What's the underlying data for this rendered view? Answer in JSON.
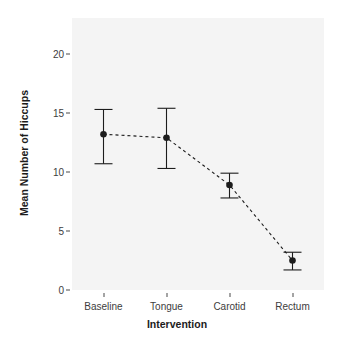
{
  "chart_data": {
    "type": "line",
    "title": "",
    "subtitle": "",
    "xlabel": "Intervention",
    "ylabel": "Mean Number of Hiccups",
    "categories": [
      "Baseline",
      "Tongue",
      "Carotid",
      "Rectum"
    ],
    "values": [
      13.2,
      12.9,
      8.9,
      2.5
    ],
    "error_low": [
      10.7,
      10.3,
      7.8,
      1.7
    ],
    "error_high": [
      15.3,
      15.4,
      9.9,
      3.2
    ],
    "series": [
      {
        "name": "Mean Number of Hiccups",
        "values": [
          13.2,
          12.9,
          8.9,
          2.5
        ]
      }
    ],
    "ylim": [
      0,
      22.5
    ],
    "yticks": [
      0,
      5,
      10,
      15,
      20
    ],
    "ytick_labels": [
      "0",
      "5",
      "10",
      "15",
      "20"
    ],
    "xtick_labels": [
      "Baseline",
      "Tongue",
      "Carotid",
      "Rectum"
    ],
    "grid": false,
    "legend": "none",
    "line_style": "dashed",
    "marker": "filled-circle",
    "errorbar_style": "capped",
    "panel_background": "#f4f4f4",
    "plot_foreground": "#1c1c1c",
    "tick_label_color": "#3d3d3d",
    "figure_background": "#ffffff"
  },
  "axes": {
    "y_title": "Mean Number of Hiccups",
    "x_title": "Intervention",
    "y_tick_0": "0",
    "y_tick_1": "5",
    "y_tick_2": "10",
    "y_tick_3": "15",
    "y_tick_4": "20",
    "x_tick_0": "Baseline",
    "x_tick_1": "Tongue",
    "x_tick_2": "Carotid",
    "x_tick_3": "Rectum"
  }
}
